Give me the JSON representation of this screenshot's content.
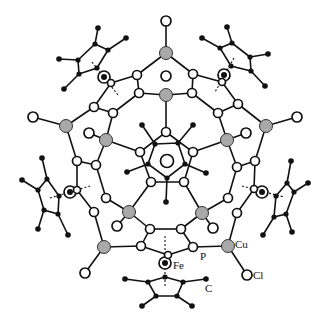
{
  "figure": {
    "type": "molecular-structure"
  },
  "labels": {
    "fe": "Fe",
    "p": "P",
    "cu": "Cu",
    "cl": "Cl",
    "c": "C"
  },
  "legend_atoms": {
    "gray_filled": "Cu",
    "open_small": "P / C / Cl",
    "black_small": "C (cyclopentadienyl)",
    "ringed_black": "Fe"
  },
  "colors": {
    "bond": "#111111",
    "cu_fill": "#a9a9a9",
    "background": "#ffffff"
  }
}
